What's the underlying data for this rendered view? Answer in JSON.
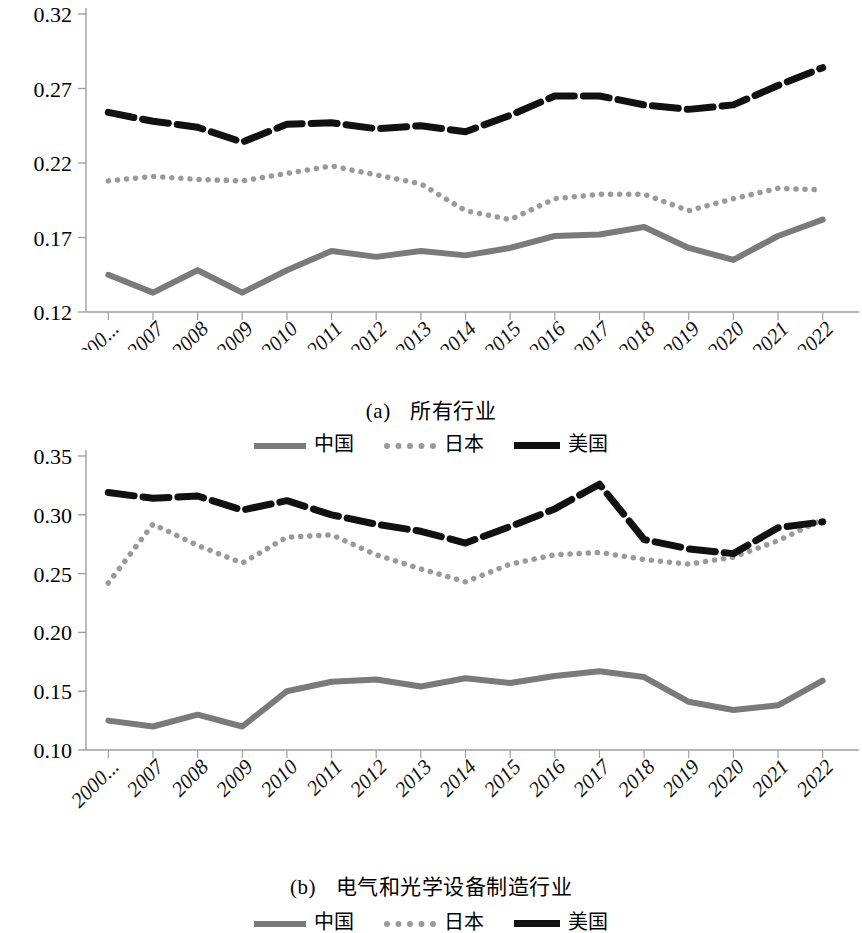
{
  "figure": {
    "panels": [
      {
        "id": "a",
        "caption_marker": "(a)",
        "caption_text": "所有行业",
        "legend": [
          {
            "name": "china",
            "label": "中国",
            "style": "solid",
            "color": "#7a7a7a"
          },
          {
            "name": "japan",
            "label": "日本",
            "style": "dotted",
            "color": "#9a9a9a"
          },
          {
            "name": "usa",
            "label": "美国",
            "style": "dashed",
            "color": "#111111"
          }
        ]
      },
      {
        "id": "b",
        "caption_marker": "(b)",
        "caption_text": "电气和光学设备制造行业",
        "legend": [
          {
            "name": "china",
            "label": "中国",
            "style": "solid",
            "color": "#7a7a7a"
          },
          {
            "name": "japan",
            "label": "日本",
            "style": "dotted",
            "color": "#9a9a9a"
          },
          {
            "name": "usa",
            "label": "美国",
            "style": "dashed",
            "color": "#111111"
          }
        ]
      }
    ]
  },
  "chart_data": [
    {
      "type": "line",
      "id": "chart-a",
      "title": "(a) 所有行业",
      "xlabel": "",
      "ylabel": "",
      "grid": false,
      "legend_position": "bottom",
      "categories": [
        "2000...",
        "2007",
        "2008",
        "2009",
        "2010",
        "2011",
        "2012",
        "2013",
        "2014",
        "2015",
        "2016",
        "2017",
        "2018",
        "2019",
        "2020",
        "2021",
        "2022"
      ],
      "yticks": [
        0.12,
        0.17,
        0.22,
        0.27,
        0.32
      ],
      "ylim": [
        0.12,
        0.32
      ],
      "series": [
        {
          "name": "中国",
          "key": "china",
          "style": "solid",
          "color": "#7a7a7a",
          "values": [
            0.145,
            0.133,
            0.148,
            0.133,
            0.148,
            0.161,
            0.157,
            0.161,
            0.158,
            0.163,
            0.171,
            0.172,
            0.177,
            0.163,
            0.155,
            0.171,
            0.182
          ]
        },
        {
          "name": "日本",
          "key": "japan",
          "style": "dotted",
          "color": "#9a9a9a",
          "values": [
            0.208,
            0.211,
            0.209,
            0.208,
            0.213,
            0.218,
            0.212,
            0.206,
            0.188,
            0.182,
            0.196,
            0.199,
            0.199,
            0.188,
            0.196,
            0.203,
            0.202
          ]
        },
        {
          "name": "美国",
          "key": "usa",
          "style": "dashed",
          "color": "#111111",
          "values": [
            0.254,
            0.248,
            0.244,
            0.234,
            0.246,
            0.247,
            0.243,
            0.245,
            0.241,
            0.252,
            0.265,
            0.265,
            0.259,
            0.256,
            0.259,
            0.272,
            0.284
          ]
        }
      ]
    },
    {
      "type": "line",
      "id": "chart-b",
      "title": "(b) 电气和光学设备制造行业",
      "xlabel": "",
      "ylabel": "",
      "grid": false,
      "legend_position": "bottom",
      "categories": [
        "2000...",
        "2007",
        "2008",
        "2009",
        "2010",
        "2011",
        "2012",
        "2013",
        "2014",
        "2015",
        "2016",
        "2017",
        "2018",
        "2019",
        "2020",
        "2021",
        "2022"
      ],
      "yticks": [
        0.1,
        0.15,
        0.2,
        0.25,
        0.3,
        0.35
      ],
      "ylim": [
        0.1,
        0.35
      ],
      "series": [
        {
          "name": "中国",
          "key": "china",
          "style": "solid",
          "color": "#7a7a7a",
          "values": [
            0.125,
            0.12,
            0.13,
            0.12,
            0.15,
            0.158,
            0.16,
            0.154,
            0.161,
            0.157,
            0.163,
            0.167,
            0.162,
            0.141,
            0.134,
            0.138,
            0.159,
            0.164
          ]
        },
        {
          "name": "日本",
          "key": "japan",
          "style": "dotted",
          "color": "#9a9a9a",
          "values": [
            0.242,
            0.292,
            0.274,
            0.259,
            0.281,
            0.283,
            0.266,
            0.254,
            0.243,
            0.258,
            0.266,
            0.268,
            0.262,
            0.258,
            0.264,
            0.278,
            0.296
          ]
        },
        {
          "name": "美国",
          "key": "usa",
          "style": "dashed",
          "color": "#111111",
          "values": [
            0.319,
            0.314,
            0.316,
            0.304,
            0.312,
            0.3,
            0.292,
            0.286,
            0.276,
            0.29,
            0.305,
            0.326,
            0.279,
            0.271,
            0.267,
            0.289,
            0.294
          ]
        }
      ]
    }
  ]
}
